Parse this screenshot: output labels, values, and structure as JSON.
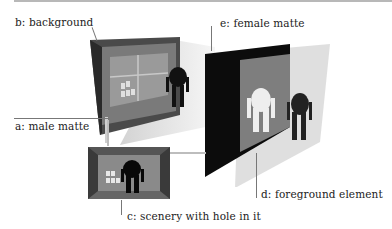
{
  "diagram": {
    "type": "compositing matte layers illustration",
    "labels": {
      "a": "a: male matte",
      "b": "b: background",
      "c": "c: scenery with hole in it",
      "d": "d: foreground element",
      "e": "e: female matte"
    },
    "colors": {
      "background": "#ffffff",
      "female_matte": "#0a0a0a",
      "male_matte_gray": "#8a8a8a",
      "foreground_plate": "#d8d8d8",
      "leader_lines": "#777777"
    }
  }
}
